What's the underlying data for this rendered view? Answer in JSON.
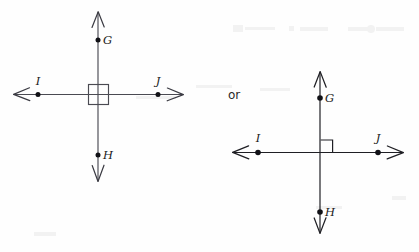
{
  "figure": {
    "background_color": "#fefefe",
    "ink_color": "#1f1f24",
    "line_color": "#4a4a52",
    "conjunction": {
      "text": "or",
      "x": 228,
      "y": 99
    }
  },
  "diagrams": [
    {
      "id": "left",
      "name": "lines-with-square-at-intersection",
      "center": {
        "x": 98,
        "y": 94
      },
      "vertical_line": {
        "x": 98,
        "y1": 12,
        "y2": 181,
        "label": "line GH"
      },
      "horizontal_line": {
        "y": 94,
        "x1": 14,
        "x2": 183,
        "label": "line IJ"
      },
      "right_angle_marker": {
        "style": "square-centered-on-intersection",
        "x": 88,
        "y": 84,
        "size": 20
      },
      "arrowheads": [
        {
          "name": "arrowhead-up",
          "direction": "up",
          "x": 98,
          "y": 12
        },
        {
          "name": "arrowhead-down",
          "direction": "down",
          "x": 98,
          "y": 181
        },
        {
          "name": "arrowhead-left",
          "direction": "left",
          "x": 14,
          "y": 94
        },
        {
          "name": "arrowhead-right",
          "direction": "right",
          "x": 183,
          "y": 94
        }
      ],
      "points": [
        {
          "label": "G",
          "x": 98,
          "y": 40,
          "label_dx": 5,
          "label_dy": 4,
          "label_anchor": "start"
        },
        {
          "label": "H",
          "x": 98,
          "y": 155,
          "label_dx": 5,
          "label_dy": 4,
          "label_anchor": "start"
        },
        {
          "label": "I",
          "x": 38,
          "y": 94,
          "label_dx": 0,
          "label_dy": -9,
          "label_anchor": "middle"
        },
        {
          "label": "J",
          "x": 158,
          "y": 94,
          "label_dx": 0,
          "label_dy": -9,
          "label_anchor": "middle"
        }
      ]
    },
    {
      "id": "right",
      "name": "lines-with-right-angle-marker",
      "center": {
        "x": 320,
        "y": 152
      },
      "vertical_line": {
        "x": 320,
        "y1": 72,
        "y2": 233,
        "label": "line GH"
      },
      "horizontal_line": {
        "y": 152,
        "x1": 233,
        "x2": 403,
        "label": "line IJ"
      },
      "right_angle_marker": {
        "style": "square-in-upper-right-quadrant",
        "x": 320,
        "y": 140,
        "size": 12
      },
      "arrowheads": [
        {
          "name": "arrowhead-up",
          "direction": "up",
          "x": 320,
          "y": 72
        },
        {
          "name": "arrowhead-down",
          "direction": "down",
          "x": 320,
          "y": 233
        },
        {
          "name": "arrowhead-left",
          "direction": "left",
          "x": 233,
          "y": 152
        },
        {
          "name": "arrowhead-right",
          "direction": "right",
          "x": 403,
          "y": 152
        }
      ],
      "points": [
        {
          "label": "G",
          "x": 320,
          "y": 98,
          "label_dx": 5,
          "label_dy": 4,
          "label_anchor": "start"
        },
        {
          "label": "H",
          "x": 320,
          "y": 212,
          "label_dx": 5,
          "label_dy": 4,
          "label_anchor": "start"
        },
        {
          "label": "I",
          "x": 258,
          "y": 152,
          "label_dx": 0,
          "label_dy": -10,
          "label_anchor": "middle"
        },
        {
          "label": "J",
          "x": 378,
          "y": 152,
          "label_dx": 0,
          "label_dy": -10,
          "label_anchor": "middle"
        }
      ]
    }
  ]
}
